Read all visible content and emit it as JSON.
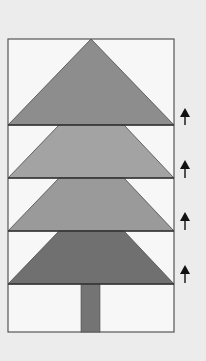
{
  "diagram": {
    "background": "#ececec",
    "frame": {
      "x": 8,
      "y": 39,
      "w": 166,
      "h": 293,
      "fill": "#f7f7f7",
      "stroke": "#555555"
    },
    "tiers": [
      {
        "name": "top-triangle",
        "points": "91,39 174,125 8,125",
        "fill": "#8d8d8d"
      },
      {
        "name": "tier-2",
        "points": "59,125 124,125 174,178 8,178",
        "fill": "#a3a3a3"
      },
      {
        "name": "tier-3",
        "points": "59,178 124,178 174,231 8,231",
        "fill": "#9a9a9a"
      },
      {
        "name": "tier-4",
        "points": "59,231 124,231 174,284 8,284",
        "fill": "#707070"
      }
    ],
    "trunk": {
      "x": 81,
      "y": 284,
      "w": 19,
      "h": 48,
      "fill": "#747474"
    },
    "arrows": [
      {
        "x": 185,
        "tip_y": 108,
        "tail_y": 125
      },
      {
        "x": 185,
        "tip_y": 160,
        "tail_y": 178
      },
      {
        "x": 185,
        "tip_y": 212,
        "tail_y": 230
      },
      {
        "x": 185,
        "tip_y": 265,
        "tail_y": 283
      }
    ],
    "arrow_color": "#111111"
  }
}
